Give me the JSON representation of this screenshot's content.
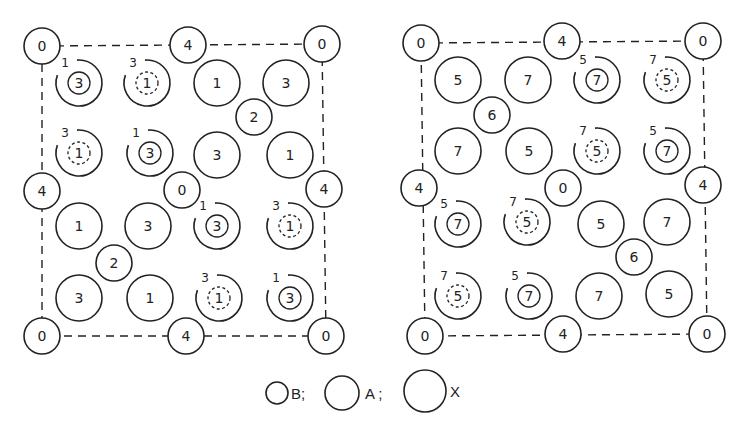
{
  "figure": {
    "panels": [
      {
        "id": "left",
        "cell_corners": [
          [
            42,
            46
          ],
          [
            322,
            44
          ],
          [
            326,
            336
          ],
          [
            42,
            336
          ]
        ],
        "x_atoms": [
          {
            "x": 42,
            "y": 46,
            "label": "0"
          },
          {
            "x": 322,
            "y": 44,
            "label": "0"
          },
          {
            "x": 42,
            "y": 336,
            "label": "0"
          },
          {
            "x": 326,
            "y": 336,
            "label": "0"
          },
          {
            "x": 188,
            "y": 45,
            "label": "4"
          },
          {
            "x": 42,
            "y": 191,
            "label": "4"
          },
          {
            "x": 324,
            "y": 189,
            "label": "4"
          },
          {
            "x": 186,
            "y": 336,
            "label": "4"
          },
          {
            "x": 182,
            "y": 190,
            "label": "0"
          }
        ],
        "b_atoms": [
          {
            "x": 254,
            "y": 117,
            "label": "2"
          },
          {
            "x": 114,
            "y": 263,
            "label": "2"
          }
        ],
        "a_atoms": [
          {
            "x": 79,
            "y": 83,
            "label": "1",
            "inner": "3",
            "inner_style": "solid"
          },
          {
            "x": 147,
            "y": 83,
            "label": "3",
            "inner": "1",
            "inner_style": "dashed"
          },
          {
            "x": 217,
            "y": 83,
            "label": "1"
          },
          {
            "x": 286,
            "y": 83,
            "label": "3"
          },
          {
            "x": 79,
            "y": 153,
            "label": "3",
            "inner": "1",
            "inner_style": "dashed"
          },
          {
            "x": 150,
            "y": 153,
            "label": "1",
            "inner": "3",
            "inner_style": "solid"
          },
          {
            "x": 217,
            "y": 155,
            "label": "3"
          },
          {
            "x": 290,
            "y": 155,
            "label": "1"
          },
          {
            "x": 79,
            "y": 226,
            "label": "1"
          },
          {
            "x": 148,
            "y": 226,
            "label": "3"
          },
          {
            "x": 217,
            "y": 226,
            "label": "1",
            "inner": "3",
            "inner_style": "solid"
          },
          {
            "x": 290,
            "y": 226,
            "label": "3",
            "inner": "1",
            "inner_style": "dashed"
          },
          {
            "x": 79,
            "y": 298,
            "label": "3"
          },
          {
            "x": 150,
            "y": 298,
            "label": "1"
          },
          {
            "x": 219,
            "y": 298,
            "label": "3",
            "inner": "1",
            "inner_style": "dashed"
          },
          {
            "x": 290,
            "y": 298,
            "label": "1",
            "inner": "3",
            "inner_style": "solid"
          }
        ]
      },
      {
        "id": "right",
        "cell_corners": [
          [
            421,
            43
          ],
          [
            703,
            41
          ],
          [
            707,
            334
          ],
          [
            425,
            336
          ]
        ],
        "x_atoms": [
          {
            "x": 421,
            "y": 43,
            "label": "0"
          },
          {
            "x": 703,
            "y": 41,
            "label": "0"
          },
          {
            "x": 425,
            "y": 336,
            "label": "0"
          },
          {
            "x": 707,
            "y": 334,
            "label": "0"
          },
          {
            "x": 562,
            "y": 41,
            "label": "4"
          },
          {
            "x": 419,
            "y": 188,
            "label": "4"
          },
          {
            "x": 703,
            "y": 185,
            "label": "4"
          },
          {
            "x": 563,
            "y": 334,
            "label": "4"
          },
          {
            "x": 563,
            "y": 188,
            "label": "0"
          }
        ],
        "b_atoms": [
          {
            "x": 492,
            "y": 115,
            "label": "6"
          },
          {
            "x": 634,
            "y": 257,
            "label": "6"
          }
        ],
        "a_atoms": [
          {
            "x": 458,
            "y": 80,
            "label": "5"
          },
          {
            "x": 528,
            "y": 80,
            "label": "7"
          },
          {
            "x": 597,
            "y": 80,
            "label": "5",
            "inner": "7",
            "inner_style": "solid"
          },
          {
            "x": 667,
            "y": 80,
            "label": "7",
            "inner": "5",
            "inner_style": "dashed"
          },
          {
            "x": 458,
            "y": 151,
            "label": "7"
          },
          {
            "x": 529,
            "y": 151,
            "label": "5"
          },
          {
            "x": 597,
            "y": 151,
            "label": "7",
            "inner": "5",
            "inner_style": "dashed"
          },
          {
            "x": 667,
            "y": 151,
            "label": "5",
            "inner": "7",
            "inner_style": "solid"
          },
          {
            "x": 458,
            "y": 224,
            "label": "5",
            "inner": "7",
            "inner_style": "solid"
          },
          {
            "x": 527,
            "y": 222,
            "label": "7",
            "inner": "5",
            "inner_style": "dashed"
          },
          {
            "x": 601,
            "y": 224,
            "label": "5"
          },
          {
            "x": 667,
            "y": 222,
            "label": "7"
          },
          {
            "x": 458,
            "y": 296,
            "label": "7",
            "inner": "5",
            "inner_style": "dashed"
          },
          {
            "x": 529,
            "y": 296,
            "label": "5",
            "inner": "7",
            "inner_style": "solid"
          },
          {
            "x": 599,
            "y": 296,
            "label": "7"
          },
          {
            "x": 669,
            "y": 294,
            "label": "5"
          }
        ]
      }
    ],
    "legend": [
      {
        "symbol": "small-circle",
        "label": "B;"
      },
      {
        "symbol": "medium-circle",
        "label": "A ;"
      },
      {
        "symbol": "large-circle",
        "label": "X"
      }
    ]
  },
  "radii": {
    "B": 18,
    "A": 23,
    "X": 18,
    "inner": 11
  },
  "colors": {
    "stroke": "#222222",
    "background": "#ffffff"
  }
}
